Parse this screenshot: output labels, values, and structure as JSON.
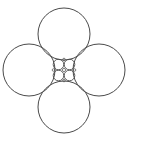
{
  "diagram": {
    "stroke_color": "#4a4a4a",
    "background": "#ffffff",
    "large_circles": [
      {
        "name": "top",
        "cx": 64,
        "cy": 34,
        "r": 26
      },
      {
        "name": "left",
        "cx": 29,
        "cy": 70,
        "r": 26
      },
      {
        "name": "right",
        "cx": 99,
        "cy": 70,
        "r": 26
      },
      {
        "name": "bottom",
        "cx": 64,
        "cy": 107,
        "r": 26
      }
    ],
    "small_circles": [
      {
        "name": "top-left",
        "cx": 58.5,
        "cy": 64.5,
        "r": 5.3
      },
      {
        "name": "top-right",
        "cx": 69.5,
        "cy": 64.5,
        "r": 5.3
      },
      {
        "name": "bottom-left",
        "cx": 58.5,
        "cy": 75.5,
        "r": 5.3
      },
      {
        "name": "bottom-right",
        "cx": 69.5,
        "cy": 75.5,
        "r": 5.3
      }
    ],
    "center_circle": {
      "cx": 64,
      "cy": 70,
      "r": 1.6
    },
    "gap_circles": [
      {
        "name": "top-gap",
        "cx": 64,
        "cy": 59.5,
        "r": 1.3
      },
      {
        "name": "bottom-gap",
        "cx": 64,
        "cy": 80.5,
        "r": 1.3
      },
      {
        "name": "left-gap",
        "cx": 53.5,
        "cy": 70,
        "r": 1.3
      },
      {
        "name": "right-gap",
        "cx": 74.5,
        "cy": 70,
        "r": 1.3
      }
    ]
  }
}
